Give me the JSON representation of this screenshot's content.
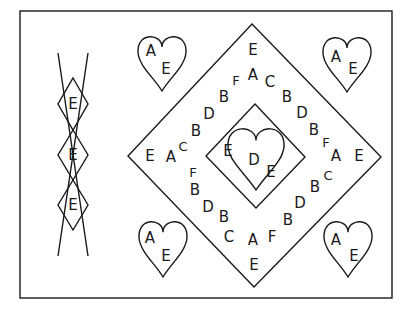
{
  "figure": {
    "border": {
      "x": 20,
      "y": 11,
      "w": 372,
      "h": 287
    },
    "stroke_color": "#1a1a1a",
    "background": "#ffffff"
  },
  "chain": {
    "lines": [
      {
        "x1": 58,
        "y1": 53,
        "x2": 88,
        "y2": 256
      },
      {
        "x1": 88,
        "y1": 53,
        "x2": 58,
        "y2": 256
      }
    ],
    "diamonds": [
      {
        "cx": 73,
        "cy": 104,
        "hw": 15,
        "hh": 26,
        "letter": "E"
      },
      {
        "cx": 73,
        "cy": 155,
        "hw": 15,
        "hh": 25,
        "letter": "E"
      },
      {
        "cx": 73,
        "cy": 205,
        "hw": 15,
        "hh": 25,
        "letter": "E"
      }
    ]
  },
  "outer_diamond": {
    "top": [
      252,
      24
    ],
    "right": [
      381,
      157
    ],
    "bottom": [
      254,
      287
    ],
    "left": [
      128,
      156
    ]
  },
  "inner_diamond": {
    "top": [
      255,
      104
    ],
    "right": [
      305,
      157
    ],
    "bottom": [
      256,
      208
    ],
    "left": [
      206,
      156
    ]
  },
  "center_heart": {
    "cx": 256,
    "top": 128,
    "bottom": 190,
    "halfwidth": 28,
    "letters": [
      {
        "ch": "E",
        "x": 228,
        "y": 151
      },
      {
        "ch": "D",
        "x": 254,
        "y": 160
      },
      {
        "ch": "E",
        "x": 271,
        "y": 172
      }
    ]
  },
  "corner_hearts": [
    {
      "name": "top-left",
      "cx": 162,
      "top": 36,
      "bottom": 91,
      "halfwidth": 24,
      "letters": [
        {
          "ch": "A",
          "x": 151,
          "y": 51
        },
        {
          "ch": "E",
          "x": 166,
          "y": 69
        }
      ]
    },
    {
      "name": "top-right",
      "cx": 347,
      "top": 37,
      "bottom": 92,
      "halfwidth": 24,
      "letters": [
        {
          "ch": "A",
          "x": 336,
          "y": 57
        },
        {
          "ch": "E",
          "x": 353,
          "y": 69
        }
      ]
    },
    {
      "name": "bottom-left",
      "cx": 163,
      "top": 221,
      "bottom": 277,
      "halfwidth": 24,
      "letters": [
        {
          "ch": "A",
          "x": 150,
          "y": 238
        },
        {
          "ch": "E",
          "x": 166,
          "y": 256
        }
      ]
    },
    {
      "name": "bottom-right",
      "cx": 348,
      "top": 221,
      "bottom": 277,
      "halfwidth": 24,
      "letters": [
        {
          "ch": "A",
          "x": 336,
          "y": 240
        },
        {
          "ch": "E",
          "x": 354,
          "y": 256
        }
      ]
    }
  ],
  "ring_letters": [
    {
      "ch": "E",
      "x": 253,
      "y": 50
    },
    {
      "ch": "A",
      "x": 253,
      "y": 75
    },
    {
      "ch": "F",
      "x": 236,
      "y": 80,
      "small": true
    },
    {
      "ch": "C",
      "x": 270,
      "y": 82
    },
    {
      "ch": "B",
      "x": 224,
      "y": 97
    },
    {
      "ch": "B",
      "x": 287,
      "y": 97
    },
    {
      "ch": "D",
      "x": 209,
      "y": 114
    },
    {
      "ch": "D",
      "x": 302,
      "y": 113
    },
    {
      "ch": "B",
      "x": 196,
      "y": 131
    },
    {
      "ch": "B",
      "x": 314,
      "y": 130
    },
    {
      "ch": "C",
      "x": 183,
      "y": 146,
      "small": true
    },
    {
      "ch": "F",
      "x": 326,
      "y": 142,
      "small": true
    },
    {
      "ch": "E",
      "x": 150,
      "y": 156
    },
    {
      "ch": "A",
      "x": 171,
      "y": 157
    },
    {
      "ch": "A",
      "x": 336,
      "y": 156
    },
    {
      "ch": "E",
      "x": 359,
      "y": 156
    },
    {
      "ch": "F",
      "x": 193,
      "y": 172,
      "small": true
    },
    {
      "ch": "C",
      "x": 328,
      "y": 175,
      "small": true
    },
    {
      "ch": "B",
      "x": 195,
      "y": 190
    },
    {
      "ch": "B",
      "x": 315,
      "y": 187
    },
    {
      "ch": "D",
      "x": 208,
      "y": 207
    },
    {
      "ch": "D",
      "x": 300,
      "y": 203
    },
    {
      "ch": "B",
      "x": 224,
      "y": 217
    },
    {
      "ch": "B",
      "x": 288,
      "y": 220
    },
    {
      "ch": "C",
      "x": 229,
      "y": 237
    },
    {
      "ch": "F",
      "x": 272,
      "y": 237
    },
    {
      "ch": "A",
      "x": 253,
      "y": 240
    },
    {
      "ch": "E",
      "x": 254,
      "y": 265
    }
  ]
}
